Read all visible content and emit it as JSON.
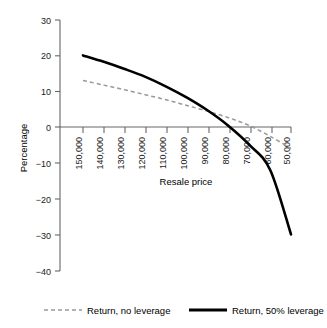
{
  "chart_data": {
    "type": "line",
    "title": "",
    "xlabel": "Resale price",
    "ylabel": "Percentage",
    "x": [
      150000,
      140000,
      130000,
      120000,
      110000,
      100000,
      90000,
      80000,
      70000,
      60000,
      50000
    ],
    "xtick_labels": [
      "150,000",
      "140,000",
      "130,000",
      "120,000",
      "110,000",
      "100,000",
      "90,000",
      "80,000",
      "70,000",
      "60,000",
      "50,000"
    ],
    "ytick_labels": [
      "30",
      "20",
      "10",
      "0",
      "−10",
      "−20",
      "−30",
      "−40"
    ],
    "yticks": [
      30,
      20,
      10,
      0,
      -10,
      -20,
      -30,
      -40
    ],
    "ylim": [
      -40,
      30
    ],
    "xlim_order": "descending",
    "grid": false,
    "legend_position": "bottom",
    "series": [
      {
        "name": "Return, no leverage",
        "style": "dashed",
        "color": "#999999",
        "values": [
          13.0,
          11.7,
          10.4,
          9.0,
          7.6,
          6.0,
          4.4,
          2.6,
          0.4,
          -2.6,
          -6.0
        ]
      },
      {
        "name": "Return, 50% leverage",
        "style": "solid",
        "color": "#000000",
        "values": [
          20.0,
          18.2,
          16.2,
          14.0,
          11.3,
          8.2,
          4.6,
          0.3,
          -5.0,
          -12.0,
          -30.0
        ]
      }
    ]
  },
  "axes": {
    "y_title": "Percentage",
    "x_title": "Resale price",
    "y_ticks": [
      "30",
      "20",
      "10",
      "0",
      "−10",
      "−20",
      "−30",
      "−40"
    ],
    "x_ticks": [
      "150,000",
      "140,000",
      "130,000",
      "120,000",
      "110,000",
      "100,000",
      "90,000",
      "80,000",
      "70,000",
      "60,000",
      "50,000"
    ]
  },
  "legend": {
    "items": [
      {
        "label": "Return, no leverage",
        "swatch": "dashed-gray-line"
      },
      {
        "label": "Return, 50% leverage",
        "swatch": "solid-black-line"
      }
    ]
  },
  "colors": {
    "series_no_leverage": "#999999",
    "series_leverage": "#000000",
    "axis": "#555555",
    "background": "#ffffff"
  }
}
